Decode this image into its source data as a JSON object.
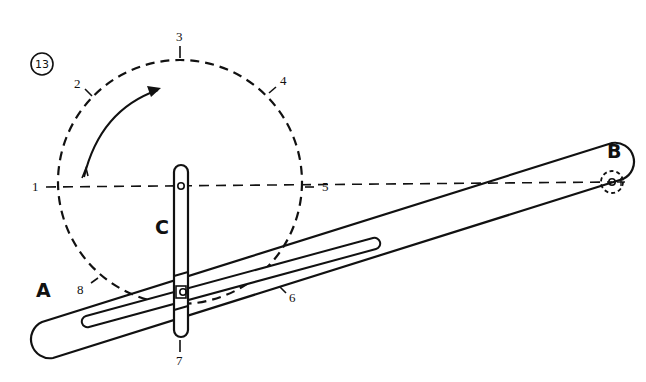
{
  "figure": {
    "number": "13"
  },
  "parts": {
    "lever": {
      "label": "A"
    },
    "pivot": {
      "label": "B"
    },
    "crank": {
      "label": "C"
    }
  },
  "positions": {
    "p1": "1",
    "p2": "2",
    "p3": "3",
    "p4": "4",
    "p5": "5",
    "p6": "6",
    "p7": "7",
    "p8": "8"
  },
  "rotation": {
    "direction": "clockwise"
  },
  "colors": {
    "ink": "#111111",
    "paper": "#ffffff"
  }
}
